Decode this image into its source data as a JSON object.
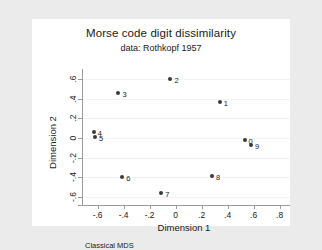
{
  "chart_data": {
    "type": "scatter",
    "title": "Morse code digit dissimilarity",
    "subtitle": "data: Rothkopf 1957",
    "note": "Classical MDS",
    "xlabel": "Dimension 1",
    "ylabel": "Dimension 2",
    "xlim": [
      -0.72,
      0.88
    ],
    "ylim": [
      -0.68,
      0.66
    ],
    "xticks": [
      "-.6",
      "-.4",
      "-.2",
      "0",
      ".2",
      ".4",
      ".6",
      ".8"
    ],
    "xtickvalues": [
      -0.6,
      -0.4,
      -0.2,
      0,
      0.2,
      0.4,
      0.6,
      0.8
    ],
    "yticks": [
      ".6",
      ".4",
      ".2",
      "0",
      "-.2",
      "-.4",
      "-.6"
    ],
    "ytickvalues": [
      0.6,
      0.4,
      0.2,
      0,
      -0.2,
      -0.4,
      -0.6
    ],
    "grid": "horizontal",
    "legend": "none",
    "marker_color": "#3a3a3a",
    "points": [
      {
        "label": "0",
        "x": 0.53,
        "y": -0.02
      },
      {
        "label": "1",
        "x": 0.34,
        "y": 0.37
      },
      {
        "label": "2",
        "x": -0.04,
        "y": 0.6
      },
      {
        "label": "3",
        "x": -0.44,
        "y": 0.46
      },
      {
        "label": "4",
        "x": -0.63,
        "y": 0.06
      },
      {
        "label": "5",
        "x": -0.62,
        "y": 0.01
      },
      {
        "label": "6",
        "x": -0.41,
        "y": -0.4
      },
      {
        "label": "7",
        "x": -0.11,
        "y": -0.56
      },
      {
        "label": "8",
        "x": 0.28,
        "y": -0.39
      },
      {
        "label": "9",
        "x": 0.58,
        "y": -0.07
      }
    ]
  }
}
